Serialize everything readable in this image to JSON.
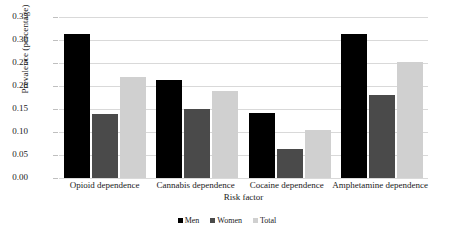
{
  "chart_data": {
    "type": "bar",
    "title": "",
    "subtitle": "",
    "xlabel": "Risk factor",
    "ylabel": "Prevalence (percentage)",
    "ylim": [
      0.0,
      0.35
    ],
    "ytick_labels": [
      "0.00",
      "0.05",
      "0.10",
      "0.15",
      "0.20",
      "0.25",
      "0.30",
      "0.35"
    ],
    "ytick_values": [
      0.0,
      0.05,
      0.1,
      0.15,
      0.2,
      0.25,
      0.3,
      0.35
    ],
    "grid": "horizontal",
    "legend_position": "bottom-center",
    "categories": [
      "Opioid dependence",
      "Cannabis dependence",
      "Cocaine dependence",
      "Amphetamine dependence"
    ],
    "series": [
      {
        "name": "Men",
        "color": "#000000",
        "values": [
          0.312,
          0.212,
          0.142,
          0.313
        ]
      },
      {
        "name": "Women",
        "color": "#4a4a4a",
        "values": [
          0.14,
          0.15,
          0.062,
          0.18
        ]
      },
      {
        "name": "Total",
        "color": "#d0d0d0",
        "values": [
          0.22,
          0.19,
          0.105,
          0.253
        ]
      }
    ],
    "annotations": []
  }
}
